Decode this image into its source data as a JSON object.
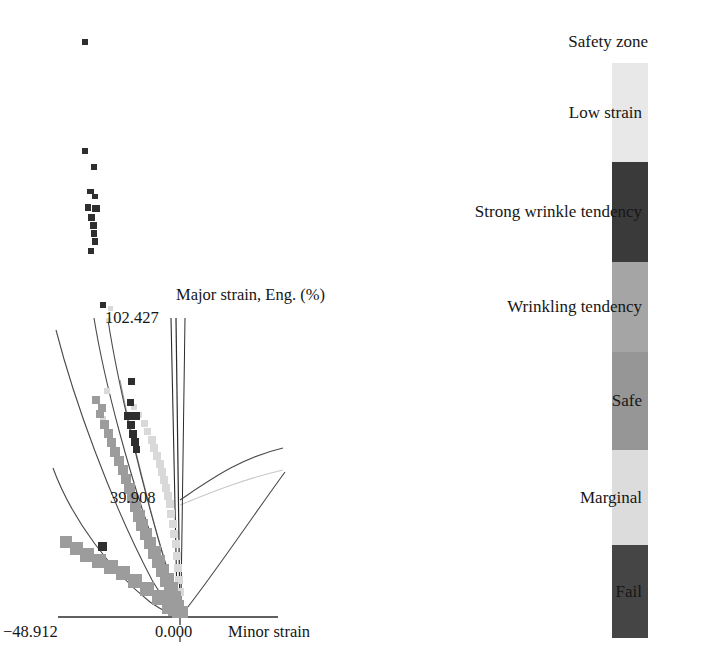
{
  "figure": {
    "type": "forming-limit-diagram",
    "background": "#ffffff"
  },
  "plot": {
    "axis": {
      "x_axis_label": "Minor strain",
      "y_axis_label": "Major strain, Eng. (%)",
      "x_ticks": [
        "−48.912",
        "0.000"
      ],
      "x_tick_values": [
        -48.912,
        0.0
      ],
      "y_ticks": [
        "39.908",
        "102.427"
      ],
      "y_tick_values": [
        39.908,
        102.427
      ],
      "x_min_label": "−48.912",
      "x_zero_label": "0.000",
      "y_mid_label": "39.908",
      "y_max_label": "102.427"
    },
    "origin_px": [
      180,
      617
    ],
    "axis_line_color": "#2b2b2b",
    "curve_color": "#4a4a4a",
    "point_colors": {
      "dark": "#2e2e2e",
      "mid_gray": "#9a9a9a",
      "light_gray": "#d8d8d8"
    }
  },
  "chart_data": {
    "type": "scatter",
    "title": "",
    "xlabel": "Minor strain",
    "ylabel": "Major strain, Eng. (%)",
    "xlim": [
      -48.912,
      40.0
    ],
    "ylim": [
      0.0,
      130.0
    ],
    "xticks": [
      -48.912,
      0.0
    ],
    "xticklabels": [
      "−48.912",
      "0.000"
    ],
    "yticks": [
      39.908,
      102.427
    ],
    "yticklabels": [
      "39.908",
      "102.427"
    ],
    "grid": false,
    "legend_position": "right",
    "series": [
      {
        "name": "Fail",
        "color": "#2e2e2e",
        "points": [
          [
            -21.5,
            142.0
          ],
          [
            -21.0,
            111.0
          ],
          [
            -20.0,
            105.0
          ],
          [
            -20.5,
            95.0
          ],
          [
            -19.8,
            91.0
          ],
          [
            -19.2,
            88.0
          ],
          [
            -19.6,
            85.0
          ],
          [
            -19.0,
            83.0
          ],
          [
            -19.4,
            80.0
          ],
          [
            -19.9,
            77.0
          ],
          [
            -18.5,
            74.5
          ],
          [
            -20.2,
            72.0
          ],
          [
            -17.5,
            62.0
          ],
          [
            -15.5,
            59.5
          ],
          [
            -14.8,
            56.0
          ],
          [
            -14.2,
            53.5
          ],
          [
            -14.6,
            51.0
          ],
          [
            -14.0,
            49.0
          ],
          [
            -30.5,
            21.0
          ]
        ]
      },
      {
        "name": "Marginal",
        "color": "#d8d8d8",
        "points": [
          [
            -23.5,
            67.0
          ],
          [
            -22.5,
            63.0
          ],
          [
            -16.5,
            46.0
          ],
          [
            -15.5,
            42.0
          ],
          [
            -14.5,
            38.0
          ],
          [
            -13.5,
            34.0
          ],
          [
            -12.5,
            31.0
          ],
          [
            -11.5,
            28.0
          ],
          [
            -10.5,
            25.0
          ],
          [
            -9.5,
            22.0
          ],
          [
            -8.5,
            19.0
          ],
          [
            -7.0,
            15.0
          ],
          [
            -5.5,
            11.0
          ],
          [
            -4.0,
            8.0
          ],
          [
            -2.5,
            5.0
          ]
        ]
      },
      {
        "name": "Safe",
        "color": "#9a9a9a",
        "points": [
          [
            -24.5,
            61.0
          ],
          [
            -23.5,
            58.0
          ],
          [
            -22.5,
            55.0
          ],
          [
            -21.5,
            52.0
          ],
          [
            -20.5,
            49.0
          ],
          [
            -19.5,
            46.0
          ],
          [
            -18.5,
            43.0
          ],
          [
            -17.5,
            40.0
          ],
          [
            -16.5,
            37.0
          ],
          [
            -15.5,
            34.0
          ],
          [
            -14.5,
            31.0
          ],
          [
            -13.5,
            28.0
          ],
          [
            -12.5,
            25.0
          ],
          [
            -11.5,
            22.0
          ],
          [
            -10.5,
            19.0
          ],
          [
            -9.5,
            16.0
          ],
          [
            -8.0,
            13.0
          ],
          [
            -6.5,
            10.0
          ],
          [
            -5.0,
            7.0
          ],
          [
            -3.5,
            4.5
          ],
          [
            -2.0,
            2.5
          ],
          [
            -31.5,
            22.0
          ],
          [
            -29.0,
            19.5
          ],
          [
            -27.0,
            17.0
          ],
          [
            -25.0,
            14.5
          ],
          [
            -23.0,
            12.0
          ],
          [
            -21.0,
            10.0
          ],
          [
            -18.0,
            8.0
          ],
          [
            -15.0,
            6.0
          ],
          [
            -12.0,
            4.5
          ],
          [
            -8.0,
            3.0
          ],
          [
            -4.0,
            1.5
          ],
          [
            -1.0,
            0.8
          ]
        ]
      }
    ],
    "limit_curves": [
      {
        "name": "safety-zone-boundary",
        "side": "left-outer"
      },
      {
        "name": "low-strain-boundary",
        "side": "left-mid"
      },
      {
        "name": "wrinkle-boundary",
        "side": "left-inner"
      },
      {
        "name": "fld-curve",
        "side": "right-upper"
      },
      {
        "name": "shear-line",
        "side": "right-lower"
      }
    ]
  },
  "legend": {
    "title": "Safety zone",
    "bands": [
      {
        "label": "Low strain",
        "color": "#e8e8e8",
        "height_px": 99
      },
      {
        "label": "Strong wrinkle tendency",
        "color": "#3a3a3a",
        "height_px": 100
      },
      {
        "label": "Wrinkling tendency",
        "color": "#a5a5a5",
        "height_px": 90
      },
      {
        "label": "Safe",
        "color": "#969696",
        "height_px": 98
      },
      {
        "label": "Marginal",
        "color": "#dcdcdc",
        "height_px": 95
      },
      {
        "label": "Fail",
        "color": "#454545",
        "height_px": 93
      }
    ]
  }
}
